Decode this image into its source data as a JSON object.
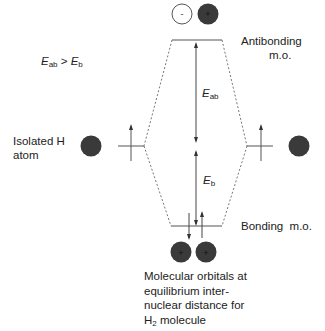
{
  "inequality": {
    "lhs_symbol": "E",
    "lhs_sub": "ab",
    "op": " > ",
    "rhs_symbol": "E",
    "rhs_sub": "b"
  },
  "labels": {
    "antibonding_line1": "Antibonding",
    "antibonding_line2": "m.o.",
    "isolated_line1": "Isolated H",
    "isolated_line2": "atom",
    "bonding": "Bonding  m.o.",
    "caption_line1": "Molecular orbitals at",
    "caption_line2": "equilibrium inter-",
    "caption_line3": "nuclear distance for",
    "caption_h": "H",
    "caption_h_sub": "2",
    "caption_rest": " molecule"
  },
  "energies": {
    "eab_symbol": "E",
    "eab_sub": "ab",
    "eb_symbol": "E",
    "eb_sub": "b"
  },
  "orbitals": {
    "antibonding": [
      {
        "sign": "-",
        "fill": "#ffffff"
      },
      {
        "sign": "+",
        "fill": "#3a3a3a"
      }
    ],
    "bonding": [
      {
        "sign": "+",
        "fill": "#3a3a3a"
      },
      {
        "sign": "+",
        "fill": "#3a3a3a"
      }
    ]
  },
  "colors": {
    "line": "#555555",
    "dark": "#3a3a3a"
  }
}
